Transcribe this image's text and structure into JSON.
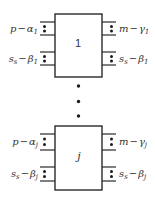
{
  "diagram": {
    "blocks": [
      {
        "id": "1",
        "label": "1",
        "ports": {
          "left_top": {
            "var": "p",
            "op": "−",
            "greek": "α",
            "sub": "1"
          },
          "left_bottom": {
            "var": "s",
            "var_sub": "s",
            "op": "−",
            "greek": "β",
            "sub": "1"
          },
          "right_top": {
            "var": "m",
            "op": "−",
            "greek": "γ",
            "sub": "1"
          },
          "right_bottom": {
            "var": "s",
            "var_sub": "s",
            "op": "−",
            "greek": "β",
            "sub": "1"
          }
        }
      },
      {
        "id": "j",
        "label": "j",
        "ports": {
          "left_top": {
            "var": "p",
            "op": "−",
            "greek": "α",
            "sub": "j"
          },
          "left_bottom": {
            "var": "s",
            "var_sub": "s",
            "op": "−",
            "greek": "β",
            "sub": "j"
          },
          "right_top": {
            "var": "m",
            "op": "−",
            "greek": "γ",
            "sub": "j"
          },
          "right_bottom": {
            "var": "s",
            "var_sub": "s",
            "op": "−",
            "greek": "β",
            "sub": "j"
          }
        }
      }
    ],
    "ellipsis": "⋮",
    "colors": {
      "stroke": "#2a2a2a",
      "text": "#333333",
      "background": "#ffffff"
    }
  }
}
